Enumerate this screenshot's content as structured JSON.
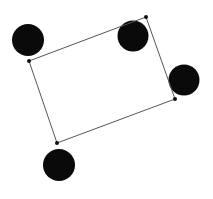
{
  "canvas": {
    "width": 213,
    "height": 199,
    "background": "#ffffff"
  },
  "colors": {
    "circle": "#0a0a0a",
    "line": "#555555",
    "vertex": "#111111"
  },
  "rectangle": {
    "vertices": [
      {
        "x": 29,
        "y": 61
      },
      {
        "x": 146,
        "y": 17
      },
      {
        "x": 175,
        "y": 99
      },
      {
        "x": 57,
        "y": 143
      }
    ]
  },
  "circles": [
    {
      "cx": 28,
      "cy": 40,
      "r": 16
    },
    {
      "cx": 133,
      "cy": 36,
      "r": 15.5
    },
    {
      "cx": 184,
      "cy": 80,
      "r": 15.5
    },
    {
      "cx": 59,
      "cy": 165,
      "r": 16
    }
  ]
}
